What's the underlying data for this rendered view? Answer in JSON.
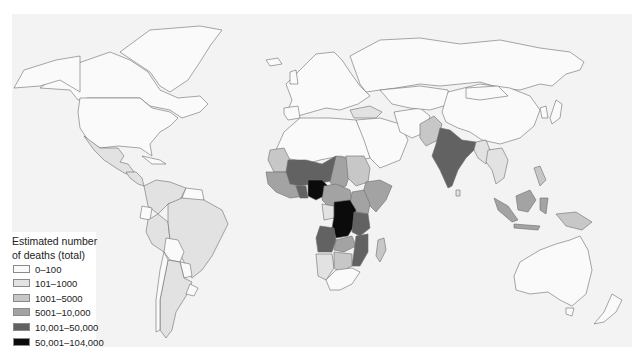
{
  "map": {
    "title": "Estimated number of deaths (total)",
    "background_color": "#f3f3f3",
    "border_color": "#6d6d6d"
  },
  "legend": {
    "title_line1": "Estimated number",
    "title_line2": "of deaths (total)",
    "items": [
      {
        "label": "0–100",
        "color": "#fafafa"
      },
      {
        "label": "101–1000",
        "color": "#e2e2e2"
      },
      {
        "label": "1001–5000",
        "color": "#c7c7c7"
      },
      {
        "label": "5001–10,000",
        "color": "#a3a3a3"
      },
      {
        "label": "10,001–50,000",
        "color": "#626262"
      },
      {
        "label": "50,001–104,000",
        "color": "#0b0b0b"
      }
    ]
  },
  "regions": {
    "nigeria": "50,001–104,000",
    "dr_congo": "50,001–104,000",
    "india": "10,001–50,000",
    "niger_mali_region": "10,001–50,000",
    "angola_zambia_region": "10,001–50,000",
    "tanzania_mozambique": "10,001–50,000",
    "indonesia": "5001–10,000",
    "east_africa": "5001–10,000",
    "pakistan_myanmar_brazil": "1001–5000 / 101–1000",
    "north_america_europe_russia_australia": "0–100"
  }
}
